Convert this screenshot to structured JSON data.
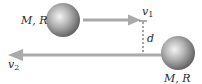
{
  "diagram": {
    "type": "two-body collision / flyby diagram",
    "colors": {
      "sphere_light": "#f2f2f2",
      "sphere_mid": "#a8a8a8",
      "sphere_dark": "#5e5e5e",
      "arrow": "#a9a9a9",
      "dashed_line": "#333333",
      "text": "#2a2a2a"
    },
    "top_body": {
      "label": "M, R",
      "velocity_label": "v",
      "velocity_subscript": "1",
      "direction": "right"
    },
    "bottom_body": {
      "label": "M, R",
      "velocity_label": "v",
      "velocity_subscript": "2",
      "direction": "left"
    },
    "separation": {
      "label": "d"
    }
  }
}
